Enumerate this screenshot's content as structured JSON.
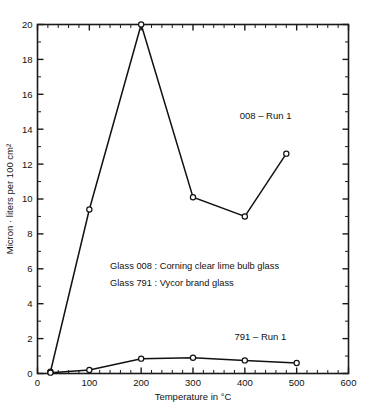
{
  "chart_data": {
    "type": "line",
    "title": "",
    "subtitle": "",
    "xlabel": "Temperature in °C",
    "ylabel": "Micron · liters per 100 cm²",
    "xlim": [
      0,
      600
    ],
    "ylim": [
      0,
      20
    ],
    "grid": false,
    "legend_position": "inline-annotation",
    "x_ticks": [
      0,
      100,
      200,
      300,
      400,
      500,
      600
    ],
    "x_tick_labels": [
      "0",
      "100",
      "200",
      "300",
      "400",
      "500",
      "600"
    ],
    "x_minor_step": 20,
    "y_ticks": [
      0,
      2,
      4,
      6,
      8,
      10,
      12,
      14,
      16,
      18,
      20
    ],
    "y_tick_labels": [
      "0",
      "2",
      "4",
      "6",
      "8",
      "10",
      "12",
      "14",
      "16",
      "18",
      "20"
    ],
    "y_minor_step": 1,
    "marker": "open-circle",
    "line_color": "#111111",
    "background_color": "#ffffff",
    "series": [
      {
        "name": "008 - Run 1",
        "label": "008 – Run 1",
        "label_x": 440,
        "label_y": 14.6,
        "x": [
          25,
          100,
          200,
          300,
          400,
          480
        ],
        "values": [
          0.1,
          9.4,
          20.0,
          10.1,
          9.0,
          12.6
        ]
      },
      {
        "name": "791 - Run 1",
        "label": "791 – Run 1",
        "label_x": 430,
        "label_y": 1.9,
        "x": [
          25,
          100,
          200,
          300,
          400,
          500
        ],
        "values": [
          0.05,
          0.2,
          0.85,
          0.9,
          0.75,
          0.6
        ]
      }
    ],
    "annotations": [
      {
        "text": "Glass 008 : Corning clear lime bulb glass",
        "x": 140,
        "y": 6.0
      },
      {
        "text": "Glass 791 : Vycor brand glass",
        "x": 140,
        "y": 5.0
      }
    ]
  }
}
